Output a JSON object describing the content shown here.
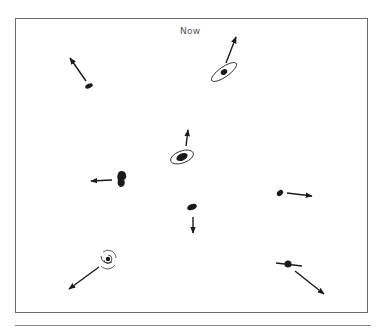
{
  "diagram": {
    "title": "Now",
    "colors": {
      "ink": "#1a1a1a",
      "frame": "#6a6a6a",
      "title": "#555555"
    },
    "galaxies": [
      {
        "id": "top-left",
        "shape": "ellipse",
        "x": 89,
        "y": 86,
        "direction": "up-left"
      },
      {
        "id": "top-right",
        "shape": "ringed-ellipse",
        "x": 224,
        "y": 72,
        "direction": "up-right"
      },
      {
        "id": "center",
        "shape": "ringed-ellipse",
        "x": 182,
        "y": 157,
        "direction": "up"
      },
      {
        "id": "left",
        "shape": "blob",
        "x": 121,
        "y": 179,
        "direction": "left"
      },
      {
        "id": "center-lower",
        "shape": "ellipse",
        "x": 192,
        "y": 207,
        "direction": "down"
      },
      {
        "id": "right",
        "shape": "ellipse",
        "x": 280,
        "y": 193,
        "direction": "right"
      },
      {
        "id": "bottom-left",
        "shape": "spiral",
        "x": 108,
        "y": 259,
        "direction": "down-left"
      },
      {
        "id": "bottom-right",
        "shape": "edge-on-disk",
        "x": 288,
        "y": 264,
        "direction": "down-right"
      }
    ]
  }
}
